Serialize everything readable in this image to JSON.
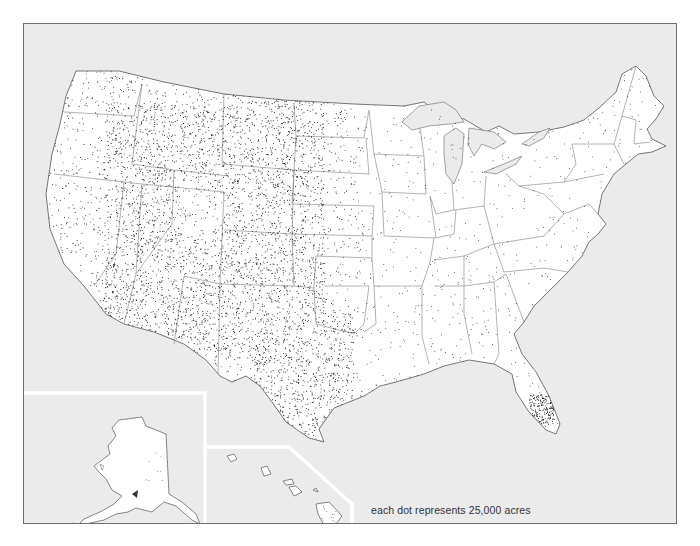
{
  "map": {
    "title": "",
    "legend": {
      "text": "each dot represents 25,000 acres",
      "dot_value_acres": 25000
    },
    "regions": [
      {
        "name": "contiguous-united-states",
        "inset": false
      },
      {
        "name": "alaska",
        "inset": true
      },
      {
        "name": "hawaii",
        "inset": true
      }
    ],
    "colors": {
      "background": "#ebebeb",
      "land": "#ffffff",
      "water": "#ebebeb",
      "dots": "#111111",
      "borders": "#555555",
      "inset_divider": "#ffffff"
    }
  }
}
